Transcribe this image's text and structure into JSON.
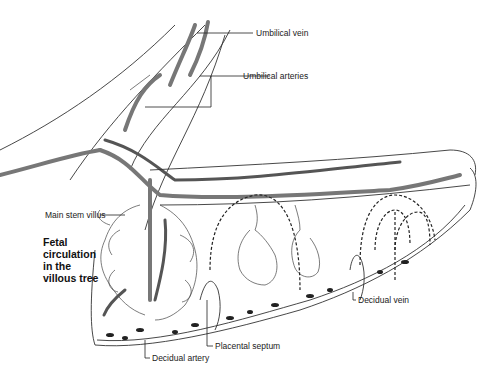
{
  "diagram": {
    "labels": {
      "umbilical_vein": "Umbilical vein",
      "umbilical_arteries": "Umbilical arteries",
      "main_stem_villus": "Main stem villus",
      "fetal_circulation_line1": "Fetal",
      "fetal_circulation_line2": "circulation",
      "fetal_circulation_line3": "in the",
      "fetal_circulation_line4": "villous tree",
      "decidual_vein": "Decidual vein",
      "placental_septum": "Placental septum",
      "decidual_artery": "Decidual artery"
    },
    "colors": {
      "vessel": "#777777",
      "outline": "#333333",
      "text": "#222222",
      "background": "#ffffff"
    }
  }
}
